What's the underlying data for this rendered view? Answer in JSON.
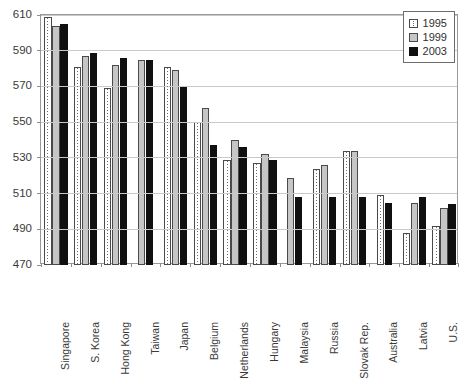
{
  "chart_data": {
    "type": "bar",
    "title": "",
    "subtitle": "",
    "xlabel": "",
    "ylabel": "",
    "ylim": [
      470,
      610
    ],
    "ytick_step": 20,
    "yticks": [
      470,
      490,
      510,
      530,
      550,
      570,
      590,
      610
    ],
    "grid": "horizontal",
    "legend_position": "top-right",
    "categories": [
      "Singapore",
      "S. Korea",
      "Hong Kong",
      "Taiwan",
      "Japan",
      "Belgium",
      "Netherlands",
      "Hungary",
      "Malaysia",
      "Russia",
      "Slovak Rep.",
      "Australia",
      "Latvia",
      "U.S."
    ],
    "series": [
      {
        "name": "1995",
        "color": "#ffffff",
        "pattern": "dotted-vertical",
        "values": [
          609,
          581,
          569,
          null,
          581,
          550,
          529,
          527,
          null,
          524,
          534,
          509,
          488,
          492
        ]
      },
      {
        "name": "1999",
        "color": "#c6c6c6",
        "pattern": "solid",
        "values": [
          604,
          587,
          582,
          585,
          579,
          558,
          540,
          532,
          519,
          526,
          534,
          null,
          505,
          502
        ]
      },
      {
        "name": "2003",
        "color": "#101010",
        "pattern": "solid",
        "values": [
          605,
          589,
          586,
          585,
          570,
          537,
          536,
          529,
          508,
          508,
          508,
          505,
          508,
          504
        ]
      }
    ]
  },
  "legend": {
    "entries": [
      {
        "label": "1995"
      },
      {
        "label": "1999"
      },
      {
        "label": "2003"
      }
    ]
  },
  "axis": {
    "y_tick_labels": [
      "610",
      "590",
      "570",
      "550",
      "530",
      "510",
      "490",
      "470"
    ]
  }
}
